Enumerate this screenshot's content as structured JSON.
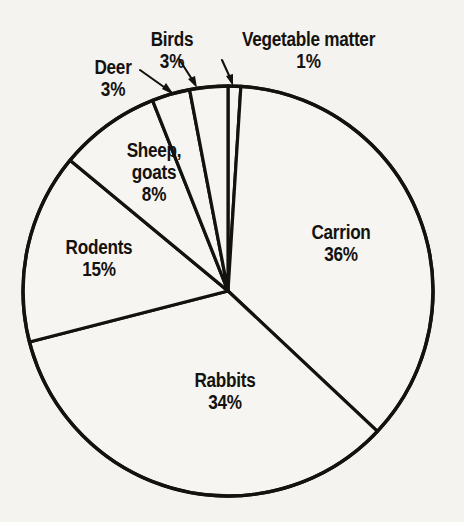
{
  "figure": {
    "background_color": "#f5f3ef",
    "ink_color": "#14120f",
    "slice_fill": "#f7f5f1"
  },
  "chart_data": {
    "type": "pie",
    "title": "",
    "subtitle": "",
    "xlabel": "",
    "ylabel": "",
    "legend_position": "none",
    "grid": false,
    "units": "percent",
    "start_angle_deg": 0,
    "direction": "clockwise",
    "categories": [
      "Vegetable matter",
      "Carrion",
      "Rabbits",
      "Rodents",
      "Sheep, goats",
      "Deer",
      "Birds"
    ],
    "values": [
      1,
      36,
      34,
      15,
      8,
      3,
      3
    ],
    "labels": [
      "Vegetable matter",
      "Carrion",
      "Rabbits",
      "Rodents",
      "Sheep, goats",
      "Deer",
      "Birds"
    ],
    "value_labels": [
      "1%",
      "36%",
      "34%",
      "15%",
      "8%",
      "3%",
      "3%"
    ]
  },
  "slices": [
    {
      "key": "vegetable-matter",
      "name": "Vegetable matter",
      "name_line1": "Vegetable matter",
      "name_line2": "",
      "percent_label": "1%",
      "value": 1,
      "label_placement": "outside",
      "has_leader": true
    },
    {
      "key": "carrion",
      "name": "Carrion",
      "name_line1": "Carrion",
      "name_line2": "",
      "percent_label": "36%",
      "value": 36,
      "label_placement": "inside",
      "has_leader": false
    },
    {
      "key": "rabbits",
      "name": "Rabbits",
      "name_line1": "Rabbits",
      "name_line2": "",
      "percent_label": "34%",
      "value": 34,
      "label_placement": "inside",
      "has_leader": false
    },
    {
      "key": "rodents",
      "name": "Rodents",
      "name_line1": "Rodents",
      "name_line2": "",
      "percent_label": "15%",
      "value": 15,
      "label_placement": "inside",
      "has_leader": false
    },
    {
      "key": "sheep-goats",
      "name": "Sheep, goats",
      "name_line1": "Sheep,",
      "name_line2": "goats",
      "percent_label": "8%",
      "value": 8,
      "label_placement": "inside",
      "has_leader": false
    },
    {
      "key": "deer",
      "name": "Deer",
      "name_line1": "Deer",
      "name_line2": "",
      "percent_label": "3%",
      "value": 3,
      "label_placement": "outside",
      "has_leader": true
    },
    {
      "key": "birds",
      "name": "Birds",
      "name_line1": "Birds",
      "name_line2": "",
      "percent_label": "3%",
      "value": 3,
      "label_placement": "outside",
      "has_leader": true
    }
  ]
}
